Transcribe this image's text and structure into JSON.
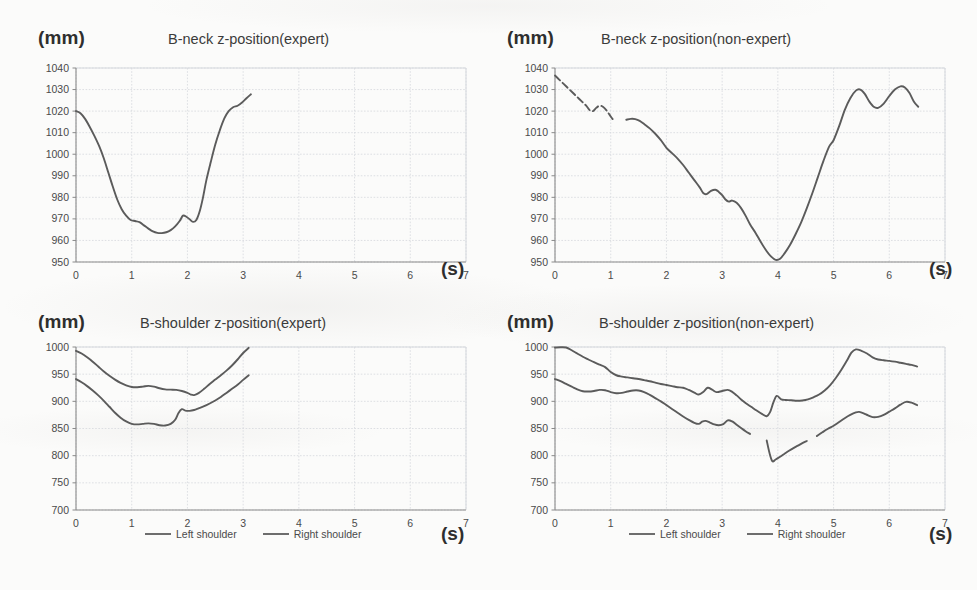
{
  "figure": {
    "background_color": "#fbfbfa",
    "line_color": "#5b5b5b",
    "grid_color": "#d5d8dd",
    "axis_color": "#8a8a8a",
    "text_color": "#3a3a3a"
  },
  "panels": [
    {
      "id": "b-neck-expert",
      "unit_label": "(mm)",
      "time_label": "(s)",
      "title": "B-neck z-position(expert)"
    },
    {
      "id": "b-neck-non-expert",
      "unit_label": "(mm)",
      "time_label": "(s)",
      "title": "B-neck z-position(non-expert)"
    },
    {
      "id": "b-shoulder-expert",
      "unit_label": "(mm)",
      "time_label": "(s)",
      "title": "B-shoulder z-position(expert)"
    },
    {
      "id": "b-shoulder-non-expert",
      "unit_label": "(mm)",
      "time_label": "(s)",
      "title": "B-shoulder z-position(non-expert)"
    }
  ],
  "legend": {
    "items": [
      {
        "label": "Left shoulder",
        "color": "#6d6d6d"
      },
      {
        "label": "Right shoulder",
        "color": "#6d6d6d"
      }
    ]
  },
  "chart_data": [
    {
      "id": "b-neck-expert",
      "type": "line",
      "title": "B-neck z-position(expert)",
      "xlabel": "(s)",
      "ylabel": "(mm)",
      "xlim": [
        0,
        7
      ],
      "ylim": [
        950,
        1040
      ],
      "xticks": [
        0,
        1,
        2,
        3,
        4,
        5,
        6,
        7
      ],
      "yticks": [
        950,
        960,
        970,
        980,
        990,
        1000,
        1010,
        1020,
        1030,
        1040
      ],
      "grid": true,
      "legend": null,
      "series": [
        {
          "name": "Neck",
          "color": "#5b5b5b",
          "x": [
            0.0,
            0.08,
            0.16,
            0.24,
            0.33,
            0.42,
            0.5,
            0.58,
            0.66,
            0.74,
            0.82,
            0.9,
            0.98,
            1.06,
            1.14,
            1.22,
            1.3,
            1.38,
            1.46,
            1.54,
            1.62,
            1.7,
            1.78,
            1.86,
            1.92,
            1.98,
            2.04,
            2.1,
            2.16,
            2.22,
            2.28,
            2.34,
            2.42,
            2.5,
            2.58,
            2.66,
            2.74,
            2.82,
            2.9,
            2.98,
            3.06,
            3.14
          ],
          "y": [
            1020.0,
            1019.0,
            1016.5,
            1013.0,
            1008.5,
            1003.5,
            998.0,
            991.5,
            985.0,
            979.0,
            974.5,
            971.5,
            969.5,
            969.0,
            968.5,
            967.0,
            965.5,
            964.2,
            963.5,
            963.4,
            963.8,
            964.8,
            966.5,
            969.0,
            971.5,
            971.0,
            969.8,
            968.6,
            969.5,
            973.5,
            980.0,
            988.0,
            996.5,
            1004.5,
            1011.0,
            1016.5,
            1020.0,
            1021.8,
            1022.5,
            1024.0,
            1026.0,
            1027.8
          ]
        }
      ]
    },
    {
      "id": "b-neck-non-expert",
      "type": "line",
      "title": "B-neck z-position(non-expert)",
      "xlabel": "(s)",
      "ylabel": "(mm)",
      "xlim": [
        0,
        7
      ],
      "ylim": [
        950,
        1040
      ],
      "xticks": [
        0,
        1,
        2,
        3,
        4,
        5,
        6,
        7
      ],
      "yticks": [
        950,
        960,
        970,
        980,
        990,
        1000,
        1010,
        1020,
        1030,
        1040
      ],
      "grid": true,
      "legend": null,
      "series": [
        {
          "name": "Neck (segment 1)",
          "color": "#5b5b5b",
          "dashed": true,
          "x": [
            0.0,
            0.08,
            0.16,
            0.24,
            0.32,
            0.4,
            0.48,
            0.56,
            0.62,
            0.68,
            0.74,
            0.8,
            0.86,
            0.92,
            1.0,
            1.06
          ],
          "y": [
            1036.5,
            1034.5,
            1032.5,
            1030.5,
            1028.5,
            1026.5,
            1024.5,
            1022.5,
            1020.5,
            1020.0,
            1021.5,
            1022.5,
            1022.0,
            1020.5,
            1017.5,
            1015.5
          ]
        },
        {
          "name": "Neck (segment 2)",
          "color": "#5b5b5b",
          "x": [
            1.28,
            1.36,
            1.44,
            1.52,
            1.6,
            1.7,
            1.8,
            1.9,
            2.0,
            2.1,
            2.2,
            2.3,
            2.4,
            2.5,
            2.6,
            2.66,
            2.72,
            2.8,
            2.88,
            2.94,
            3.0,
            3.06,
            3.12,
            3.18,
            3.26,
            3.34,
            3.42,
            3.5,
            3.6,
            3.7,
            3.8,
            3.88,
            3.96,
            4.04,
            4.12,
            4.22,
            4.32,
            4.42,
            4.52,
            4.62,
            4.72,
            4.82,
            4.92,
            5.0,
            5.1,
            5.2,
            5.3,
            5.4,
            5.48,
            5.56,
            5.64,
            5.72,
            5.8,
            5.9,
            6.0,
            6.1,
            6.2,
            6.28,
            6.36,
            6.44,
            6.52
          ],
          "y": [
            1016.0,
            1016.4,
            1016.3,
            1015.5,
            1014.0,
            1012.0,
            1009.5,
            1006.5,
            1003.0,
            1000.5,
            998.0,
            995.0,
            991.5,
            988.0,
            984.5,
            982.0,
            981.5,
            983.0,
            983.5,
            982.5,
            981.0,
            979.0,
            978.0,
            978.5,
            977.5,
            975.0,
            971.5,
            967.5,
            963.5,
            959.0,
            955.0,
            952.5,
            951.0,
            951.5,
            954.0,
            958.0,
            963.0,
            968.5,
            975.0,
            982.0,
            989.5,
            997.0,
            1003.5,
            1006.5,
            1013.0,
            1020.5,
            1026.0,
            1029.5,
            1030.0,
            1028.0,
            1024.5,
            1022.0,
            1021.5,
            1023.5,
            1027.0,
            1030.0,
            1031.5,
            1031.0,
            1028.5,
            1024.5,
            1022.0
          ]
        }
      ]
    },
    {
      "id": "b-shoulder-expert",
      "type": "line",
      "title": "B-shoulder z-position(expert)",
      "xlabel": "(s)",
      "ylabel": "(mm)",
      "xlim": [
        0,
        7
      ],
      "ylim": [
        700,
        1000
      ],
      "xticks": [
        0,
        1,
        2,
        3,
        4,
        5,
        6,
        7
      ],
      "yticks": [
        700,
        750,
        800,
        850,
        900,
        950,
        1000
      ],
      "grid": true,
      "legend": [
        "Left shoulder",
        "Right shoulder"
      ],
      "series": [
        {
          "name": "Left shoulder",
          "color": "#5b5b5b",
          "x": [
            0.0,
            0.1,
            0.2,
            0.3,
            0.4,
            0.5,
            0.6,
            0.7,
            0.8,
            0.9,
            1.0,
            1.1,
            1.2,
            1.3,
            1.4,
            1.5,
            1.6,
            1.7,
            1.8,
            1.9,
            2.0,
            2.06,
            2.12,
            2.2,
            2.3,
            2.4,
            2.5,
            2.6,
            2.7,
            2.8,
            2.9,
            3.0,
            3.1
          ],
          "y": [
            993.0,
            988.0,
            981.0,
            973.0,
            964.0,
            955.0,
            947.0,
            940.0,
            934.0,
            929.5,
            926.5,
            926.0,
            927.0,
            928.5,
            927.0,
            924.0,
            922.0,
            921.5,
            921.0,
            919.0,
            915.5,
            912.5,
            911.5,
            915.0,
            923.0,
            932.0,
            940.0,
            948.0,
            956.5,
            966.0,
            977.0,
            989.0,
            998.5
          ]
        },
        {
          "name": "Right shoulder",
          "color": "#5b5b5b",
          "x": [
            0.0,
            0.1,
            0.2,
            0.3,
            0.4,
            0.5,
            0.6,
            0.7,
            0.8,
            0.9,
            1.0,
            1.1,
            1.2,
            1.3,
            1.4,
            1.5,
            1.6,
            1.7,
            1.78,
            1.84,
            1.9,
            1.96,
            2.04,
            2.12,
            2.2,
            2.3,
            2.4,
            2.5,
            2.6,
            2.7,
            2.8,
            2.9,
            3.0,
            3.1
          ],
          "y": [
            941.0,
            935.0,
            928.0,
            920.0,
            911.0,
            901.0,
            890.0,
            879.0,
            870.0,
            863.0,
            858.5,
            857.5,
            858.5,
            859.5,
            858.5,
            856.0,
            855.5,
            858.5,
            866.0,
            878.5,
            885.5,
            883.0,
            882.5,
            884.0,
            887.0,
            891.0,
            896.0,
            901.5,
            908.0,
            915.5,
            923.0,
            930.5,
            939.5,
            948.0
          ]
        }
      ]
    },
    {
      "id": "b-shoulder-non-expert",
      "type": "line",
      "title": "B-shoulder z-position(non-expert)",
      "xlabel": "(s)",
      "ylabel": "(mm)",
      "xlim": [
        0,
        7
      ],
      "ylim": [
        700,
        1000
      ],
      "xticks": [
        0,
        1,
        2,
        3,
        4,
        5,
        6,
        7
      ],
      "yticks": [
        700,
        750,
        800,
        850,
        900,
        950,
        1000
      ],
      "grid": true,
      "legend": [
        "Left shoulder",
        "Right shoulder"
      ],
      "series": [
        {
          "name": "Left shoulder",
          "color": "#5b5b5b",
          "x": [
            0.0,
            0.1,
            0.2,
            0.3,
            0.4,
            0.5,
            0.6,
            0.7,
            0.8,
            0.9,
            1.0,
            1.1,
            1.2,
            1.3,
            1.4,
            1.5,
            1.6,
            1.7,
            1.8,
            1.9,
            2.0,
            2.1,
            2.2,
            2.3,
            2.4,
            2.5,
            2.58,
            2.66,
            2.74,
            2.82,
            2.9,
            3.0,
            3.1,
            3.18,
            3.26,
            3.34,
            3.42,
            3.52,
            3.62,
            3.72,
            3.8,
            3.86,
            3.92,
            3.98,
            4.06,
            4.14,
            4.24,
            4.34,
            4.44,
            4.54,
            4.64,
            4.74,
            4.84,
            4.94,
            5.04,
            5.14,
            5.24,
            5.32,
            5.4,
            5.5,
            5.6,
            5.7,
            5.8,
            5.9,
            6.0,
            6.1,
            6.2,
            6.3,
            6.4,
            6.5
          ],
          "y": [
            999.0,
            999.5,
            999.0,
            994.0,
            988.0,
            982.0,
            977.0,
            972.0,
            967.5,
            963.0,
            954.0,
            948.0,
            945.5,
            944.0,
            942.5,
            941.0,
            939.0,
            937.0,
            934.5,
            932.0,
            930.0,
            928.0,
            926.0,
            925.0,
            921.0,
            916.0,
            912.5,
            917.0,
            925.0,
            921.5,
            917.0,
            919.0,
            921.0,
            917.5,
            911.0,
            903.5,
            897.0,
            890.0,
            883.0,
            876.5,
            872.5,
            880.0,
            898.0,
            910.0,
            903.5,
            902.5,
            902.0,
            901.0,
            901.5,
            903.5,
            907.5,
            912.5,
            920.0,
            930.0,
            943.0,
            958.0,
            975.0,
            989.5,
            995.5,
            993.0,
            988.0,
            981.0,
            977.0,
            975.5,
            974.5,
            973.0,
            971.0,
            969.0,
            967.0,
            964.0
          ]
        },
        {
          "name": "Right shoulder (segment 1)",
          "color": "#5b5b5b",
          "x": [
            0.0,
            0.1,
            0.2,
            0.3,
            0.4,
            0.5,
            0.6,
            0.7,
            0.8,
            0.9,
            1.0,
            1.1,
            1.2,
            1.3,
            1.4,
            1.5,
            1.6,
            1.7,
            1.8,
            1.9,
            2.0,
            2.1,
            2.2,
            2.3,
            2.4,
            2.5,
            2.58,
            2.64,
            2.7,
            2.78,
            2.86,
            2.94,
            3.02,
            3.1,
            3.18,
            3.26,
            3.34,
            3.42,
            3.5
          ],
          "y": [
            941.0,
            937.0,
            932.0,
            927.0,
            922.0,
            918.5,
            918.0,
            919.0,
            921.0,
            920.5,
            917.0,
            915.0,
            915.5,
            918.0,
            920.0,
            920.0,
            917.0,
            912.0,
            906.0,
            900.0,
            893.0,
            886.0,
            879.0,
            872.0,
            866.0,
            860.5,
            858.5,
            862.5,
            864.0,
            861.0,
            857.5,
            856.0,
            858.0,
            865.0,
            863.0,
            857.0,
            851.0,
            845.0,
            840.0
          ]
        },
        {
          "name": "Right shoulder (segment 2)",
          "color": "#5b5b5b",
          "x": [
            3.8,
            3.85,
            3.9,
            3.96,
            4.04,
            4.12,
            4.2,
            4.28,
            4.36,
            4.44,
            4.52
          ],
          "y": [
            828.0,
            805.0,
            790.0,
            793.0,
            798.0,
            803.5,
            809.0,
            814.0,
            818.5,
            823.0,
            827.0
          ]
        },
        {
          "name": "Right shoulder (segment 3)",
          "color": "#5b5b5b",
          "x": [
            4.7,
            4.8,
            4.9,
            5.0,
            5.1,
            5.2,
            5.3,
            5.4,
            5.46,
            5.54,
            5.62,
            5.7,
            5.8,
            5.9,
            6.0,
            6.1,
            6.2,
            6.3,
            6.4,
            6.5
          ],
          "y": [
            836.0,
            843.0,
            849.5,
            855.0,
            862.0,
            869.0,
            875.0,
            879.5,
            880.5,
            878.0,
            874.0,
            871.0,
            871.5,
            875.0,
            881.0,
            887.0,
            894.0,
            899.0,
            897.5,
            893.0
          ]
        }
      ]
    }
  ]
}
